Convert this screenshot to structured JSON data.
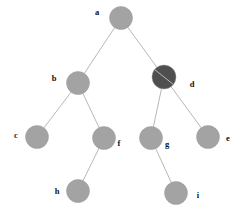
{
  "diagram": {
    "type": "tree-graph",
    "canvas": {
      "width": 247,
      "height": 215,
      "background": "#ffffff"
    },
    "style": {
      "node_fill": "#a3a3a3",
      "node_fill_highlight": "#4f4f4f",
      "node_stroke": "#9a9a9a",
      "edge_color": "#b8b8b8",
      "edge_width": 1,
      "node_radius": 11.5,
      "label_color": "#111111"
    },
    "nodes": [
      {
        "id": "a",
        "label": "a",
        "cx": 121,
        "cy": 18,
        "r": 11.5,
        "fill": "#a3a3a3",
        "highlight": false,
        "label_x": 97,
        "label_y": 13
      },
      {
        "id": "b",
        "label": "b",
        "cx": 78,
        "cy": 83,
        "r": 11.5,
        "fill": "#a3a3a3",
        "highlight": false,
        "label_x": 54,
        "label_y": 79
      },
      {
        "id": "d",
        "label": "d",
        "cx": 164,
        "cy": 77,
        "r": 12.0,
        "fill": "#4f4f4f",
        "highlight": true,
        "label_x": 192,
        "label_y": 85
      },
      {
        "id": "c",
        "label": "c",
        "cx": 37,
        "cy": 137,
        "r": 11.5,
        "fill": "#a3a3a3",
        "highlight": false,
        "label_x": 16,
        "label_y": 136
      },
      {
        "id": "f",
        "label": "f",
        "cx": 104,
        "cy": 138,
        "r": 11.5,
        "fill": "#a3a3a3",
        "highlight": false,
        "label_x": 119,
        "label_y": 144
      },
      {
        "id": "g",
        "label": "g",
        "cx": 151,
        "cy": 138,
        "r": 11.5,
        "fill": "#a3a3a3",
        "highlight": false,
        "label_x": 167,
        "label_y": 145
      },
      {
        "id": "e",
        "label": "e",
        "cx": 208,
        "cy": 137,
        "r": 11.5,
        "fill": "#a3a3a3",
        "highlight": false,
        "label_x": 228,
        "label_y": 139
      },
      {
        "id": "h",
        "label": "h",
        "cx": 78,
        "cy": 191,
        "r": 11.5,
        "fill": "#a3a3a3",
        "highlight": false,
        "label_x": 57,
        "label_y": 192
      },
      {
        "id": "i",
        "label": "i",
        "cx": 176,
        "cy": 193,
        "r": 11.5,
        "fill": "#a3a3a3",
        "highlight": false,
        "label_x": 198,
        "label_y": 196
      }
    ],
    "edges": [
      {
        "id": "a-b",
        "from": "a",
        "to": "b"
      },
      {
        "id": "a-d",
        "from": "a",
        "to": "d"
      },
      {
        "id": "b-c",
        "from": "b",
        "to": "c"
      },
      {
        "id": "b-f",
        "from": "b",
        "to": "f"
      },
      {
        "id": "d-g",
        "from": "d",
        "to": "g"
      },
      {
        "id": "d-e",
        "from": "d",
        "to": "e"
      },
      {
        "id": "f-h",
        "from": "f",
        "to": "h"
      },
      {
        "id": "g-i",
        "from": "g",
        "to": "i"
      }
    ]
  }
}
